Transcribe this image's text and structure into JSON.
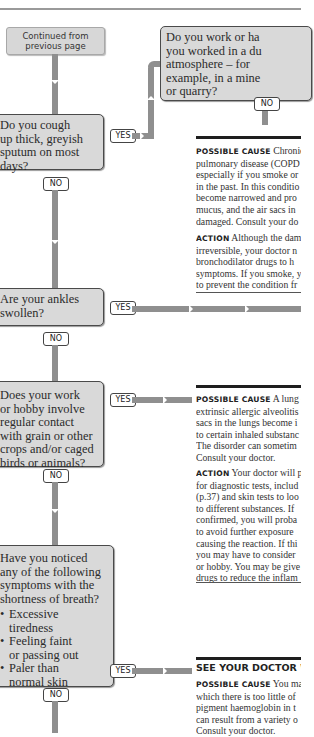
{
  "continued": "Continued from previous page",
  "questions": [
    {
      "id": "dusty",
      "text": "Do you work or have you worked in a dusty atmosphere – for example, in a mine or quarry?",
      "lines": [
        "Do you work or ha",
        "you worked in a du",
        "atmosphere – for",
        "example, in a mine",
        "or quarry?"
      ],
      "no_label": "NO"
    },
    {
      "id": "sputum",
      "text": "Do you cough up thick, greyish sputum on most days?",
      "lines": [
        "Do you cough",
        "up thick, greyish",
        "sputum on most",
        "days?"
      ],
      "yes_label": "YES",
      "no_label": "NO"
    },
    {
      "id": "ankles",
      "text": "Are your ankles swollen?",
      "lines": [
        "Are your ankles",
        "swollen?"
      ],
      "yes_label": "YES",
      "no_label": "NO"
    },
    {
      "id": "grain",
      "text": "Does your work or hobby involve regular contact with grain or other crops and/or caged birds or animals?",
      "lines": [
        "Does your work",
        "or hobby involve",
        "regular contact",
        "with grain or other",
        "crops and/or caged",
        "birds or animals?"
      ],
      "yes_label": "YES",
      "no_label": "NO"
    },
    {
      "id": "symptoms",
      "lines": [
        "Have you noticed",
        "any of the following",
        "symptoms with the",
        "shortness of breath?"
      ],
      "bullets": [
        [
          "Excessive",
          "tiredness"
        ],
        [
          "Feeling faint",
          "or passing out"
        ],
        [
          "Paler than",
          "normal skin"
        ]
      ],
      "yes_label": "YES",
      "no_label": "NO"
    }
  ],
  "results": {
    "copd": {
      "cause_label": "Possible cause",
      "cause_lines": [
        "Chronic o",
        "pulmonary disease (COPD",
        "especially if you smoke or",
        "in the past. In this conditio",
        "become narrowed and pro",
        "mucus, and the air sacs in",
        "damaged. Consult your do"
      ],
      "action_label": "Action",
      "action_lines": [
        "Although the dam",
        "irreversible, your doctor n",
        "bronchodilator drugs to h",
        "symptoms. If you smoke, y",
        "to prevent the condition fr"
      ]
    },
    "alveolitis": {
      "cause_label": "Possible cause",
      "cause_lines": [
        "A lung dis",
        "extrinsic allergic alveolitis",
        "sacs in the lungs become i",
        "to certain inhaled substanc",
        "The disorder can sometim",
        "Consult your doctor."
      ],
      "action_label": "Action",
      "action_lines": [
        "Your doctor will p",
        "for diagnostic tests, includ",
        "(p.37) and skin tests to loo",
        "to different substances. If",
        "confirmed, you will proba",
        "to avoid further exposure",
        "causing the reaction. If thi",
        "you may have to consider",
        "or hobby. You may be give",
        "drugs to reduce the inflam"
      ]
    },
    "anaemia": {
      "heading": "SEE YOUR DOCTOR W",
      "cause_label": "Possible cause",
      "cause_lines": [
        "You may",
        "which there is too little of",
        "pigment haemoglobin in t",
        "can result from a variety o",
        "Consult your doctor."
      ]
    }
  }
}
